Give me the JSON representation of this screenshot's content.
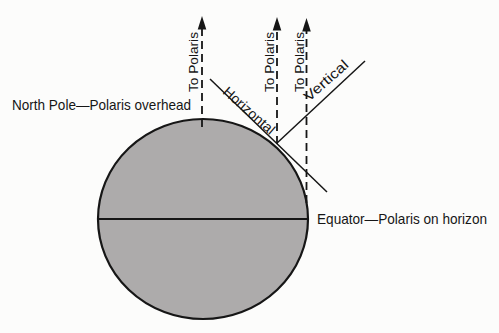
{
  "figure": {
    "colors": {
      "background": "#fcfcfb",
      "ink": "#161616",
      "earth_fill": "#adabab"
    },
    "labels": {
      "north_pole": "North Pole—Polaris overhead",
      "equator": "Equator—Polaris on horizon",
      "horizontal": "Horizontal",
      "vertical": "Vertical"
    },
    "polaris_arrows": [
      {
        "label": "To Polaris"
      },
      {
        "label": "To Polaris"
      },
      {
        "label": "To Polaris"
      }
    ]
  }
}
